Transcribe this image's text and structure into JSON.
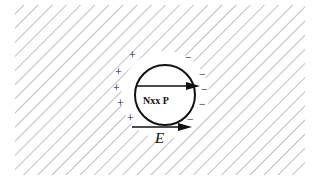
{
  "diagram": {
    "particle_label": "Nxx P",
    "field_label": "E",
    "positive_charges": [
      "+",
      "+",
      "+",
      "+",
      "+"
    ],
    "negative_charges": [
      "−",
      "−",
      "−",
      "−",
      "−"
    ],
    "colors": {
      "hatch": "#8a8a8a",
      "ink": "#111111",
      "background": "#ffffff"
    }
  }
}
